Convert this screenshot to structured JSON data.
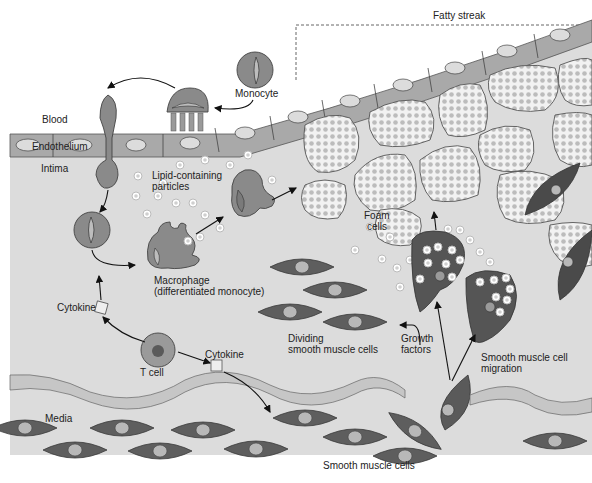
{
  "title": "Fatty streak",
  "labels": {
    "fatty_streak": "Fatty streak",
    "monocyte": "Monocyte",
    "blood": "Blood",
    "endothelium": "Endothelium",
    "intima": "Intima",
    "lipid_particles_1": "Lipid-containing",
    "lipid_particles_2": "particles",
    "foam_cells_1": "Foam",
    "foam_cells_2": "cells",
    "macrophage_1": "Macrophage",
    "macrophage_2": "(differentiated monocyte)",
    "cytokine_left": "Cytokine",
    "cytokine_right": "Cytokine",
    "t_cell": "T cell",
    "dividing_1": "Dividing",
    "dividing_2": "smooth muscle cells",
    "growth_1": "Growth",
    "growth_2": "factors",
    "migration_1": "Smooth muscle cell",
    "migration_2": "migration",
    "media": "Media",
    "smooth_muscle_cells": "Smooth muscle cells"
  },
  "colors": {
    "background": "#ffffff",
    "intima": "#d9d9d9",
    "endothelium": "#a8a8a8",
    "cell_dark": "#5a5a5a",
    "cell_mid": "#8c8c8c",
    "nucleus": "#c8c8c8",
    "foam": "#f4f4f4",
    "lipid_dot": "#bdbdbd",
    "elastic_band": "#c4c4c4"
  }
}
